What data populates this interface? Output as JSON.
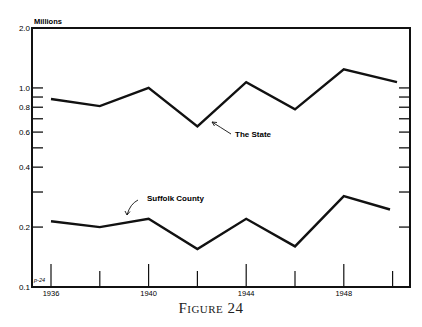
{
  "figure": {
    "caption": "Figure 24",
    "corner_mark": "p-24"
  },
  "chart_data": {
    "type": "line",
    "title": "",
    "xlabel": "",
    "ylabel": "Millions",
    "yscale": "log",
    "ylim": [
      0.1,
      2.0
    ],
    "y_tick_labels": [
      "2.0",
      "1.0",
      "0.8",
      "0.6",
      "0.4",
      "0.2",
      "0.1"
    ],
    "y_ticks_minor": [
      0.9,
      0.7,
      0.5,
      0.3
    ],
    "x_tick_labels": [
      "1936",
      "1940",
      "1944",
      "1948"
    ],
    "x": [
      1936,
      1938,
      1940,
      1942,
      1944,
      1946,
      1948,
      1950
    ],
    "grid": false,
    "legend": "inline annotations",
    "series": [
      {
        "name": "The State",
        "values": [
          0.88,
          0.81,
          1.0,
          0.64,
          1.07,
          0.78,
          1.24,
          1.07
        ]
      },
      {
        "name": "Suffolk County",
        "values": [
          0.214,
          0.2,
          0.22,
          0.155,
          0.22,
          0.16,
          0.286,
          0.245
        ]
      }
    ],
    "annotations": [
      "The State",
      "Suffolk County"
    ]
  }
}
